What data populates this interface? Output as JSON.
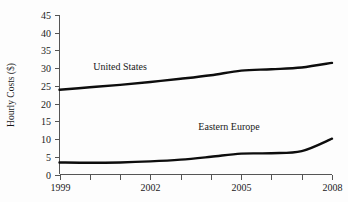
{
  "chart_data": {
    "type": "line",
    "title": "",
    "xlabel": "",
    "ylabel": "Hourly Costs ($)",
    "x": [
      1999,
      2000,
      2001,
      2002,
      2003,
      2004,
      2005,
      2006,
      2007,
      2008
    ],
    "xticks": [
      1999,
      2000,
      2001,
      2002,
      2003,
      2004,
      2005,
      2006,
      2007,
      2008
    ],
    "xtick_labels": [
      "1999",
      "",
      "",
      "2002",
      "",
      "",
      "2005",
      "",
      "",
      "2008"
    ],
    "xlim": [
      1999,
      2008
    ],
    "yticks": [
      0,
      5,
      10,
      15,
      20,
      25,
      30,
      35,
      40,
      45
    ],
    "ytick_labels": [
      "0",
      "5",
      "10",
      "15",
      "20",
      "25",
      "30",
      "35",
      "40",
      "45"
    ],
    "ylim": [
      0,
      45
    ],
    "grid": false,
    "legend_position": "inline-annotation",
    "line_color": "#0d0d0d",
    "series": [
      {
        "name": "United States",
        "label_x": 2001.0,
        "label_y": 29.6,
        "values": [
          23.9,
          24.6,
          25.3,
          26.1,
          27.0,
          28.0,
          29.3,
          29.7,
          30.2,
          31.5
        ]
      },
      {
        "name": "Eastern Europe",
        "label_x": 2004.6,
        "label_y": 12.6,
        "values": [
          3.4,
          3.3,
          3.4,
          3.7,
          4.2,
          5.0,
          5.9,
          6.0,
          6.6,
          10.1
        ]
      }
    ],
    "annotations": [
      {
        "text": "United States"
      },
      {
        "text": "Eastern Europe"
      }
    ]
  },
  "axis": {
    "y_title": "Hourly Costs ($)"
  }
}
